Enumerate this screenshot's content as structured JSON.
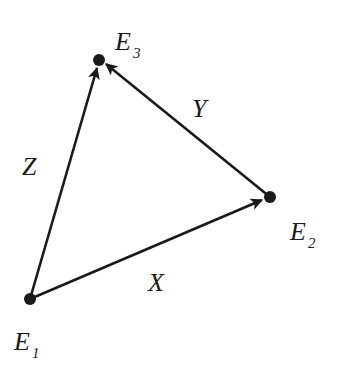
{
  "diagram": {
    "nodes": [
      {
        "id": "E1",
        "label": "E",
        "sub": "1",
        "x": 30,
        "y": 299
      },
      {
        "id": "E2",
        "label": "E",
        "sub": "2",
        "x": 270,
        "y": 197
      },
      {
        "id": "E3",
        "label": "E",
        "sub": "3",
        "x": 99,
        "y": 60
      }
    ],
    "edges": [
      {
        "from": "E1",
        "to": "E3",
        "label": "Z"
      },
      {
        "from": "E2",
        "to": "E3",
        "label": "Y"
      },
      {
        "from": "E1",
        "to": "E2",
        "label": "X"
      }
    ],
    "colors": {
      "ink": "#1a1a1a",
      "background": "#ffffff"
    }
  }
}
